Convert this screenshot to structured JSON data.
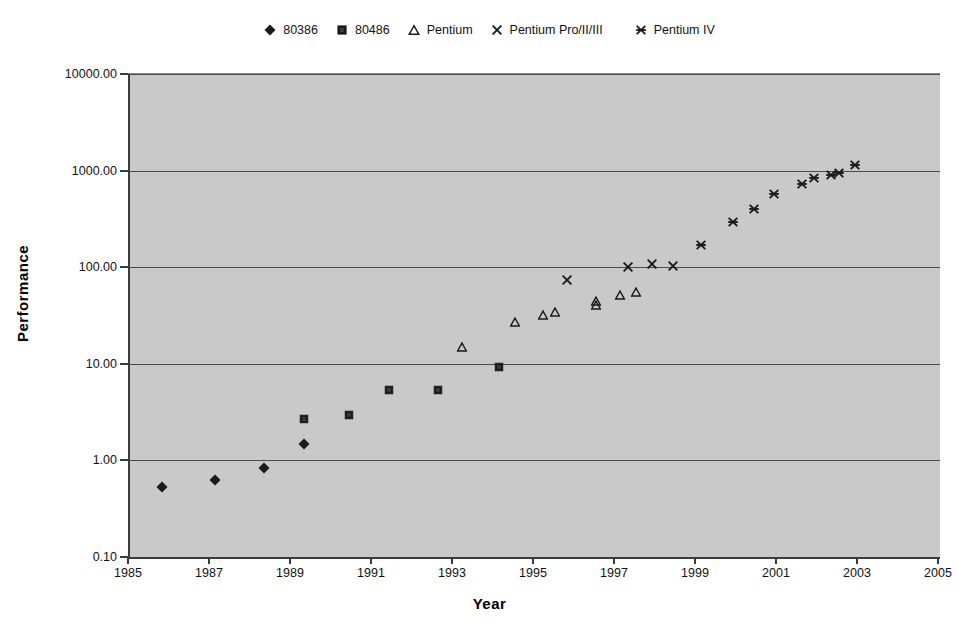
{
  "chart_data": {
    "type": "scatter",
    "title": "",
    "xlabel": "Year",
    "ylabel": "Performance",
    "xlim": [
      1985,
      2005
    ],
    "ylim": [
      0.1,
      10000.0
    ],
    "yscale": "log",
    "xscale": "linear",
    "grid": "horizontal",
    "legend_position": "top-center",
    "xticks": [
      "1985",
      "1987",
      "1989",
      "1991",
      "1993",
      "1995",
      "1997",
      "1999",
      "2001",
      "2003",
      "2005"
    ],
    "xtick_values": [
      1985,
      1987,
      1989,
      1991,
      1993,
      1995,
      1997,
      1999,
      2001,
      2003,
      2005
    ],
    "yticks": [
      "0.10",
      "1.00",
      "10.00",
      "100.00",
      "1000.00",
      "10000.00"
    ],
    "ytick_values": [
      0.1,
      1.0,
      10.0,
      100.0,
      1000.0,
      10000.0
    ],
    "plot_background": "#c9c9c9",
    "marker_color": "#1a1a1a",
    "series": [
      {
        "name": "80386",
        "marker": "diamond",
        "points": [
          {
            "x": 1985.8,
            "y": 0.55
          },
          {
            "x": 1987.1,
            "y": 0.66
          },
          {
            "x": 1988.3,
            "y": 0.88
          },
          {
            "x": 1989.3,
            "y": 1.55
          }
        ]
      },
      {
        "name": "80486",
        "marker": "square",
        "points": [
          {
            "x": 1989.3,
            "y": 2.9
          },
          {
            "x": 1990.4,
            "y": 3.2
          },
          {
            "x": 1991.4,
            "y": 5.8
          },
          {
            "x": 1992.6,
            "y": 5.7
          },
          {
            "x": 1994.1,
            "y": 10.0
          }
        ]
      },
      {
        "name": "Pentium",
        "marker": "triangle",
        "points": [
          {
            "x": 1993.2,
            "y": 16.0
          },
          {
            "x": 1994.5,
            "y": 29.0
          },
          {
            "x": 1995.2,
            "y": 34.0
          },
          {
            "x": 1995.5,
            "y": 36.5
          },
          {
            "x": 1996.5,
            "y": 44.0
          },
          {
            "x": 1996.5,
            "y": 48.0
          },
          {
            "x": 1997.1,
            "y": 56.0
          },
          {
            "x": 1997.5,
            "y": 60.0
          }
        ]
      },
      {
        "name": "Pentium Pro/II/III",
        "marker": "cross",
        "points": [
          {
            "x": 1995.8,
            "y": 78.0
          },
          {
            "x": 1997.3,
            "y": 105.0
          },
          {
            "x": 1997.9,
            "y": 112.0
          },
          {
            "x": 1998.4,
            "y": 107.0
          }
        ]
      },
      {
        "name": "Pentium IV",
        "marker": "asterisk",
        "points": [
          {
            "x": 1999.1,
            "y": 180.0
          },
          {
            "x": 1999.9,
            "y": 310.0
          },
          {
            "x": 2000.4,
            "y": 420.0
          },
          {
            "x": 2000.9,
            "y": 600.0
          },
          {
            "x": 2001.6,
            "y": 770.0
          },
          {
            "x": 2001.9,
            "y": 880.0
          },
          {
            "x": 2002.3,
            "y": 950.0
          },
          {
            "x": 2002.5,
            "y": 1000.0
          },
          {
            "x": 2002.9,
            "y": 1200.0
          }
        ]
      }
    ]
  },
  "legend": {
    "entries": [
      {
        "label": "80386",
        "marker": "diamond"
      },
      {
        "label": "80486",
        "marker": "square"
      },
      {
        "label": "Pentium",
        "marker": "triangle"
      },
      {
        "label": "Pentium Pro/II/III",
        "marker": "cross"
      },
      {
        "label": "Pentium IV",
        "marker": "asterisk"
      }
    ]
  },
  "axes": {
    "x_title": "Year",
    "y_title": "Performance"
  }
}
